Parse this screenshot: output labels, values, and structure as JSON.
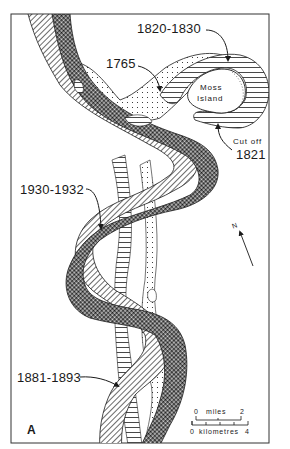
{
  "figure": {
    "panel_label": "A",
    "island_label_line1": "Moss",
    "island_label_line2": "Island",
    "cutoff_label": "Cut off",
    "cutoff_year": "1821",
    "north_label": "N"
  },
  "legend_annotations": [
    {
      "id": "ch-1765",
      "label": "1765",
      "pattern": "dotted"
    },
    {
      "id": "ch-1820",
      "label": "1820-1830",
      "pattern": "horizontal-lines"
    },
    {
      "id": "ch-1881",
      "label": "1881-1893",
      "pattern": "diagonal-hatch"
    },
    {
      "id": "ch-1930",
      "label": "1930-1932",
      "pattern": "cross-hatch"
    }
  ],
  "scale_bar": {
    "miles": {
      "label": "miles",
      "start": "0",
      "end": "2"
    },
    "kilometres": {
      "label": "kilometres",
      "start": "0",
      "end": "4"
    }
  },
  "colors": {
    "ink": "#1a1a1a",
    "paper": "#ffffff",
    "frame": "#333333"
  }
}
